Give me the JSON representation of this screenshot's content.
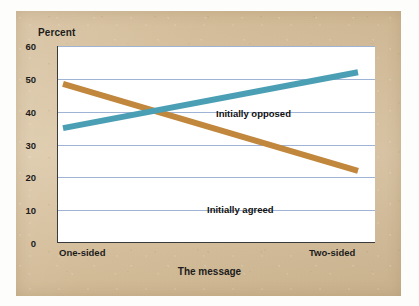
{
  "figure": {
    "panel_background_color": "#d9c3a0",
    "plot_background_color": "#ffffff",
    "gridline_color": "#9fb4d4",
    "axis_color": "#3a3a3a"
  },
  "chart_data": {
    "type": "line",
    "title": "",
    "xlabel": "The message",
    "ylabel": "Percent",
    "categories": [
      "One-sided",
      "Two-sided"
    ],
    "x": [
      0,
      1
    ],
    "ylim": [
      0,
      60
    ],
    "yticks": [
      0,
      10,
      20,
      30,
      40,
      50,
      60
    ],
    "ytick_labels": [
      "0",
      "10",
      "20",
      "30",
      "40",
      "50",
      "60"
    ],
    "grid": true,
    "grid_axis": "y",
    "legend_position": "inline-annotation",
    "series": [
      {
        "name": "Initially opposed",
        "color": "#4b9fb4",
        "values": [
          35,
          52
        ],
        "annotation": "Initially opposed"
      },
      {
        "name": "Initially agreed",
        "color": "#c1873c",
        "values": [
          48.5,
          22
        ],
        "annotation": "Initially agreed"
      }
    ],
    "annotations": [
      {
        "text": "Initially opposed",
        "series": "Initially opposed"
      },
      {
        "text": "Initially agreed",
        "series": "Initially agreed"
      }
    ],
    "crossing_point": {
      "x_fraction": 0.29,
      "y_value": 40
    }
  }
}
